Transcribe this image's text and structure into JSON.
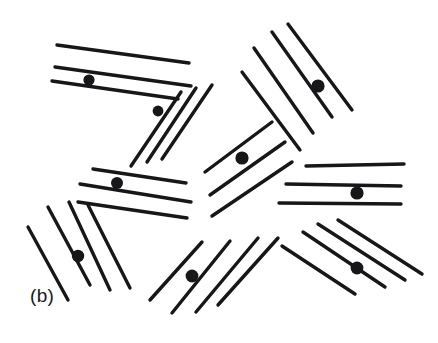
{
  "figure": {
    "panel_label": "(b)",
    "caption_text": "(b)",
    "width": 438,
    "height": 343,
    "background_color": "#ffffff",
    "ink_color": "#17171a",
    "defect_color": "#17171a"
  },
  "chart_data": {
    "type": "scatter",
    "title": "(b)",
    "subtitle": "",
    "xlabel": "",
    "ylabel": "",
    "xlim": [
      0,
      438
    ],
    "ylim": [
      0,
      343
    ],
    "grid": false,
    "legend": false,
    "domains": [
      {
        "id": "domain-1",
        "name": "top-left-horizontal-group",
        "orientation_deg": 7.8,
        "line_count": 3,
        "lines": [
          {
            "x1": 57,
            "y1": 45,
            "x2": 189,
            "y2": 63
          },
          {
            "x1": 55,
            "y1": 67,
            "x2": 191,
            "y2": 86
          },
          {
            "x1": 52,
            "y1": 81,
            "x2": 178,
            "y2": 99
          }
        ],
        "defect": {
          "cx": 89,
          "cy": 80,
          "r": 5.6
        }
      },
      {
        "id": "domain-2",
        "name": "upper-middle-diagonal-group",
        "orientation_deg": -56,
        "line_count": 3,
        "lines": [
          {
            "x1": 131,
            "y1": 166,
            "x2": 181,
            "y2": 92
          },
          {
            "x1": 147,
            "y1": 162,
            "x2": 196,
            "y2": 88
          },
          {
            "x1": 162,
            "y1": 159,
            "x2": 212,
            "y2": 85
          }
        ],
        "defect": {
          "cx": 158,
          "cy": 111,
          "r": 5.4
        }
      },
      {
        "id": "domain-3",
        "name": "top-right-diagonal-group",
        "orientation_deg": 55,
        "line_count": 4,
        "lines": [
          {
            "x1": 254,
            "y1": 48,
            "x2": 313,
            "y2": 133
          },
          {
            "x1": 272,
            "y1": 32,
            "x2": 332,
            "y2": 117
          },
          {
            "x1": 288,
            "y1": 24,
            "x2": 352,
            "y2": 110
          },
          {
            "x1": 242,
            "y1": 72,
            "x2": 300,
            "y2": 150
          }
        ],
        "defect": {
          "cx": 318,
          "cy": 86,
          "r": 6.6
        }
      },
      {
        "id": "domain-4",
        "name": "left-middle-horizontal-group",
        "orientation_deg": 9.5,
        "line_count": 3,
        "lines": [
          {
            "x1": 93,
            "y1": 169,
            "x2": 186,
            "y2": 183
          },
          {
            "x1": 80,
            "y1": 184,
            "x2": 191,
            "y2": 202
          },
          {
            "x1": 78,
            "y1": 202,
            "x2": 187,
            "y2": 218
          }
        ],
        "defect": {
          "cx": 117,
          "cy": 183,
          "r": 6.0
        }
      },
      {
        "id": "domain-5",
        "name": "center-diagonal-group",
        "orientation_deg": -37,
        "line_count": 3,
        "lines": [
          {
            "x1": 205,
            "y1": 172,
            "x2": 272,
            "y2": 122
          },
          {
            "x1": 210,
            "y1": 195,
            "x2": 285,
            "y2": 142
          },
          {
            "x1": 212,
            "y1": 216,
            "x2": 292,
            "y2": 162
          }
        ],
        "defect": {
          "cx": 242,
          "cy": 158,
          "r": 6.6
        }
      },
      {
        "id": "domain-6",
        "name": "right-middle-horizontal-group",
        "orientation_deg": 1.5,
        "line_count": 3,
        "lines": [
          {
            "x1": 306,
            "y1": 166,
            "x2": 404,
            "y2": 164
          },
          {
            "x1": 286,
            "y1": 184,
            "x2": 401,
            "y2": 186
          },
          {
            "x1": 279,
            "y1": 203,
            "x2": 401,
            "y2": 204
          }
        ],
        "defect": {
          "cx": 357,
          "cy": 193,
          "r": 6.6
        }
      },
      {
        "id": "domain-7",
        "name": "lower-left-steep-group",
        "orientation_deg": 66,
        "line_count": 4,
        "lines": [
          {
            "x1": 28,
            "y1": 227,
            "x2": 68,
            "y2": 300
          },
          {
            "x1": 48,
            "y1": 207,
            "x2": 90,
            "y2": 285
          },
          {
            "x1": 69,
            "y1": 202,
            "x2": 110,
            "y2": 290
          },
          {
            "x1": 88,
            "y1": 205,
            "x2": 130,
            "y2": 288
          }
        ],
        "defect": {
          "cx": 78,
          "cy": 256,
          "r": 6.2
        }
      },
      {
        "id": "domain-8",
        "name": "bottom-center-diagonal-group",
        "orientation_deg": -46,
        "line_count": 4,
        "lines": [
          {
            "x1": 150,
            "y1": 300,
            "x2": 202,
            "y2": 242
          },
          {
            "x1": 172,
            "y1": 313,
            "x2": 230,
            "y2": 241
          },
          {
            "x1": 196,
            "y1": 312,
            "x2": 258,
            "y2": 238
          },
          {
            "x1": 218,
            "y1": 305,
            "x2": 278,
            "y2": 238
          }
        ],
        "defect": {
          "cx": 192,
          "cy": 276,
          "r": 6.4
        }
      },
      {
        "id": "domain-9",
        "name": "bottom-right-diagonal-group",
        "orientation_deg": -34,
        "line_count": 4,
        "lines": [
          {
            "x1": 282,
            "y1": 246,
            "x2": 355,
            "y2": 294
          },
          {
            "x1": 303,
            "y1": 232,
            "x2": 385,
            "y2": 287
          },
          {
            "x1": 318,
            "y1": 224,
            "x2": 405,
            "y2": 280
          },
          {
            "x1": 338,
            "y1": 220,
            "x2": 422,
            "y2": 274
          }
        ],
        "defect": {
          "cx": 357,
          "cy": 268,
          "r": 6.4
        }
      }
    ],
    "defect_points": [
      {
        "x": 89,
        "y": 80
      },
      {
        "x": 158,
        "y": 111
      },
      {
        "x": 318,
        "y": 86
      },
      {
        "x": 117,
        "y": 183
      },
      {
        "x": 242,
        "y": 158
      },
      {
        "x": 357,
        "y": 193
      },
      {
        "x": 78,
        "y": 256
      },
      {
        "x": 192,
        "y": 276
      },
      {
        "x": 357,
        "y": 268
      }
    ],
    "defect_count": 9,
    "line_total": 31,
    "annotations": [
      {
        "text": "(b)",
        "x": 30,
        "y": 299
      }
    ]
  }
}
